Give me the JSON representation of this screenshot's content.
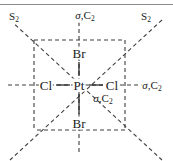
{
  "figure": {
    "type": "chemical-symmetry-diagram",
    "colors": {
      "line": "#1b1b1b",
      "dashed": "#4a4a4a",
      "text": "#1b1b1b",
      "background": "#ffffff",
      "rule": "#8a8a8a"
    },
    "atoms": [
      {
        "id": "center",
        "label": "Pt",
        "x": 79,
        "y": 85
      },
      {
        "id": "ligand-top",
        "label": "Br",
        "x": 79,
        "y": 53
      },
      {
        "id": "ligand-bottom",
        "label": "Br",
        "x": 79,
        "y": 123
      },
      {
        "id": "ligand-left",
        "label": "Cl",
        "x": 46,
        "y": 85
      },
      {
        "id": "ligand-right",
        "label": "Cl",
        "x": 112,
        "y": 85
      }
    ],
    "symmetry_labels": [
      {
        "id": "s2-top-left",
        "sigma": "",
        "text": "S",
        "sub": "2",
        "x": 14,
        "y": 17
      },
      {
        "id": "sigma-c2-top",
        "sigma": "σ",
        "text": ",C",
        "sub": "2",
        "x": 85,
        "y": 16
      },
      {
        "id": "s2-top-right",
        "sigma": "",
        "text": "S",
        "sub": "2",
        "x": 146,
        "y": 17
      },
      {
        "id": "sigma-c2-right",
        "sigma": "σ",
        "text": ",C",
        "sub": "2",
        "x": 152,
        "y": 86
      },
      {
        "id": "sigma-c2-diag",
        "sigma": "σ",
        "text": ",C",
        "sub": "2",
        "x": 103,
        "y": 99
      }
    ],
    "bond_lines": [
      {
        "id": "bond-center-top",
        "x1": 79,
        "y1": 77,
        "x2": 79,
        "y2": 62
      },
      {
        "id": "bond-center-bottom",
        "x1": 79,
        "y1": 93,
        "x2": 79,
        "y2": 114
      },
      {
        "id": "bond-center-left",
        "x1": 71,
        "y1": 85,
        "x2": 55,
        "y2": 85
      },
      {
        "id": "bond-center-right",
        "x1": 88,
        "y1": 85,
        "x2": 104,
        "y2": 85
      }
    ],
    "square": {
      "left": 34,
      "top": 40,
      "right": 125,
      "bottom": 130
    },
    "axes": {
      "vertical_mirror": {
        "x": 79,
        "y1": 24,
        "y2": 152
      },
      "horizontal_mirror": {
        "y": 85,
        "x1": 10,
        "x2": 148
      },
      "diagonal_nwse": {
        "x1": 12,
        "y1": 22,
        "x2": 160,
        "y2": 158
      },
      "diagonal_nesw": {
        "x1": 160,
        "y1": 22,
        "x2": 12,
        "y2": 158
      }
    },
    "top_rule": {
      "y": 4,
      "x1": 0,
      "x2": 173
    }
  }
}
